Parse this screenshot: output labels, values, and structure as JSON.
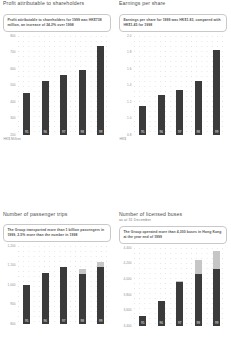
{
  "panels": [
    {
      "id": "profit-attributable",
      "title": "Profit attributable to shareholders",
      "subtitle_small": "",
      "callout": "Profit attributable to shareholders for 1999 was HK$738 million, an increase of 24.2% over 1998",
      "unit_caption": "HK$ Million"
    },
    {
      "id": "earnings-per-share",
      "title": "Earnings per share",
      "subtitle_small": "",
      "callout": "Earnings per share for 1999 was HK$1.83, compared with HK$1.45 for 1998",
      "unit_caption": "HK$"
    },
    {
      "id": "passenger-trips",
      "title": "Number of passenger trips",
      "subtitle_small": "",
      "callout": "The Group transported more than 1 billion passengers in 1999, 2.5% more than the number in 1998",
      "unit_caption": ""
    },
    {
      "id": "licensed-buses",
      "title": "Number of licensed buses",
      "subtitle_small": "as at 31 December",
      "callout": "The Group operated more than 4,300 buses in Hong Kong at the year end of 1999",
      "unit_caption": ""
    }
  ],
  "chart_data": [
    {
      "type": "bar",
      "id": "profit-attributable",
      "title": "Profit attributable to shareholders",
      "xlabel": "",
      "ylabel": "HK$ Million",
      "categories": [
        "95",
        "96",
        "97",
        "98",
        "99"
      ],
      "values": [
        455,
        530,
        565,
        595,
        738
      ],
      "ylim": [
        200,
        800
      ],
      "yticks": [
        200,
        300,
        400,
        500,
        600,
        700,
        800
      ],
      "ytick_labels": [
        "200",
        "300",
        "400",
        "500",
        "600",
        "700",
        "800"
      ],
      "grid": true,
      "legend": "none"
    },
    {
      "type": "bar",
      "id": "earnings-per-share",
      "title": "Earnings per share",
      "xlabel": "",
      "ylabel": "HK$",
      "categories": [
        "95",
        "96",
        "97",
        "98",
        "99"
      ],
      "values": [
        1.15,
        1.29,
        1.34,
        1.45,
        1.83
      ],
      "ylim": [
        0.8,
        2.0
      ],
      "yticks": [
        0.8,
        1.0,
        1.2,
        1.4,
        1.6,
        1.8,
        2.0
      ],
      "ytick_labels": [
        "0.8",
        "1.0",
        "1.2",
        "1.4",
        "1.6",
        "1.8",
        "2.0"
      ],
      "grid": true,
      "legend": "none"
    },
    {
      "type": "bar",
      "id": "passenger-trips",
      "title": "Number of passenger trips",
      "xlabel": "",
      "ylabel": "",
      "categories": [
        "95",
        "96",
        "97",
        "98",
        "99"
      ],
      "series": [
        {
          "name": "Hong Kong",
          "values": [
            1000,
            1060,
            1090,
            1055,
            1090
          ]
        },
        {
          "name": "Other",
          "values": [
            0,
            0,
            0,
            25,
            30
          ]
        }
      ],
      "values": [
        1000,
        1060,
        1090,
        1080,
        1120
      ],
      "ylim": [
        800,
        1200
      ],
      "yticks": [
        800,
        900,
        1000,
        1100,
        1200
      ],
      "ytick_labels": [
        "800",
        "900",
        "1,000",
        "1,100",
        "1,200"
      ],
      "grid": true,
      "legend": "none"
    },
    {
      "type": "bar",
      "id": "licensed-buses",
      "title": "Number of licensed buses",
      "xlabel": "",
      "ylabel": "",
      "categories": [
        "95",
        "96",
        "97",
        "98",
        "99"
      ],
      "series": [
        {
          "name": "Hong Kong",
          "values": [
            3530,
            3720,
            3960,
            4060,
            4130
          ]
        },
        {
          "name": "Other",
          "values": [
            0,
            0,
            20,
            180,
            230
          ]
        }
      ],
      "values": [
        3530,
        3720,
        3980,
        4240,
        4360
      ],
      "ylim": [
        3400,
        4400
      ],
      "yticks": [
        3400,
        3600,
        3800,
        4000,
        4200,
        4400
      ],
      "ytick_labels": [
        "3,400",
        "3,600",
        "3,800",
        "4,000",
        "4,200",
        "4,400"
      ],
      "grid": true,
      "legend": "none"
    }
  ]
}
